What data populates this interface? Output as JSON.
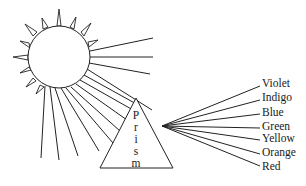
{
  "diagram": {
    "sun": {
      "label": ""
    },
    "prism": {
      "letters": [
        "P",
        "r",
        "i",
        "s",
        "m"
      ],
      "word": "Prism"
    },
    "spectrum": {
      "labels": [
        "Violet",
        "Indigo",
        "Blue",
        "Green",
        "Yellow",
        "Orange",
        "Red"
      ]
    },
    "colors": {
      "stroke": "#222222",
      "background": "#ffffff",
      "text": "#1a1a1a"
    }
  }
}
